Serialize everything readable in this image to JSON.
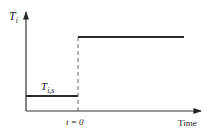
{
  "diagram": {
    "type": "step-function",
    "y_axis_label": "T",
    "y_axis_label_sub": "i",
    "low_level_label": "T",
    "low_level_label_sub": "i,s",
    "step_time_label": "t = 0",
    "x_axis_label": "Time",
    "colors": {
      "line": "#2a2a2a",
      "axis": "#333333",
      "dashed": "#666666",
      "background": "#ffffff"
    }
  }
}
